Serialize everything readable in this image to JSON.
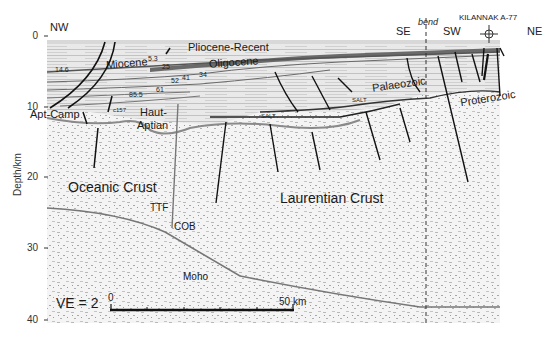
{
  "figure": {
    "type": "seismic cross-section interpretation",
    "y_axis": {
      "title": "Depth/km",
      "ticks": [
        "0",
        "10",
        "20",
        "30",
        "40"
      ]
    },
    "directions": {
      "left": "NW",
      "middle_left": "SE",
      "bend": "bend",
      "middle_right": "SW",
      "right": "NE"
    },
    "well": {
      "name": "KILANNAK A-77",
      "symbol": "well-symbol"
    },
    "units": {
      "pliocene_recent": "Pliocene-Recent",
      "miocene": "Miocene",
      "oligocene": "Oligocene",
      "palaeozoic": "Palaeozoic",
      "proterozoic": "Proterozoic",
      "apt_camp": "Apt-Camp",
      "haut": "Haut-",
      "aptian": "Aptian",
      "oceanic_crust": "Oceanic Crust",
      "laurentian_crust": "Laurentian Crust",
      "ttf": "TTF",
      "cob": "COB",
      "moho": "Moho",
      "salt_1": "SALT",
      "salt_2": "SALT"
    },
    "age_labels": {
      "a146": "14.6",
      "a53": "5.3",
      "a25": "25",
      "a52": "52",
      "a41": "41",
      "a34": "34",
      "a61": "61",
      "a855": "85.5",
      "a157": "c157"
    },
    "scale_bar": {
      "start": "0",
      "end": "50 km"
    },
    "vertical_exaggeration": "VE = 2"
  }
}
